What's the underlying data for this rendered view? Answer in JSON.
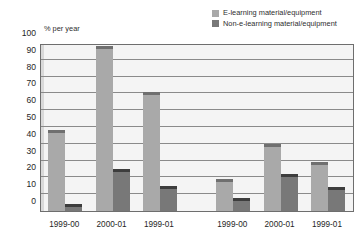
{
  "title": "",
  "y_axis_caption": "% per year",
  "legend": {
    "position": "top-right",
    "items": [
      {
        "label": "E-learning material/equipment",
        "color": "#a9a9a9",
        "name": "e-learning"
      },
      {
        "label": "Non-e-learning material/equipment",
        "color": "#787878",
        "name": "non-e-learning"
      }
    ]
  },
  "chart_data": {
    "type": "bar",
    "title": "",
    "xlabel": "",
    "ylabel": "% per year",
    "ylim": [
      0,
      100
    ],
    "yticks": [
      0,
      10,
      20,
      30,
      40,
      50,
      60,
      70,
      80,
      90,
      100
    ],
    "grid": true,
    "categories": [
      "1999-00",
      "2000-01",
      "1999-01",
      "1999-00",
      "2000-01",
      "1999-01"
    ],
    "series": [
      {
        "name": "E-learning material/equipment",
        "color": "#a9a9a9",
        "values": [
          48,
          98,
          71,
          19,
          40,
          29
        ]
      },
      {
        "name": "Non-e-learning material/equipment",
        "color": "#787878",
        "values": [
          4,
          25,
          15,
          8,
          22,
          14
        ]
      }
    ],
    "group_break_after_index": 2
  }
}
